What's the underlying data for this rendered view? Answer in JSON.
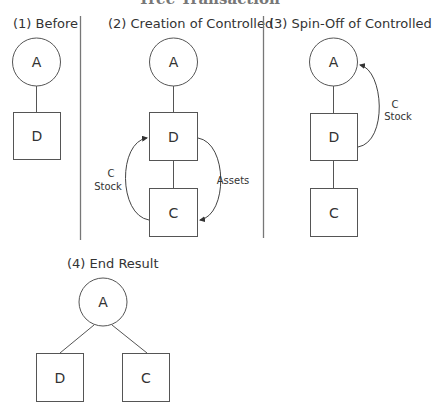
{
  "figure": {
    "cut_title": "Tree Transaction",
    "separator_color": "#777777",
    "stroke_color": "#555555"
  },
  "panels": [
    {
      "title": "(1) Before",
      "nodes": {
        "parent": "A",
        "child1": "D"
      }
    },
    {
      "title": "(2) Creation of Controlled",
      "nodes": {
        "parent": "A",
        "child1": "D",
        "child2": "C"
      },
      "edge_labels": {
        "left_line1": "C",
        "left_line2": "Stock",
        "right": "Assets"
      }
    },
    {
      "title": "(3) Spin-Off of Controlled",
      "nodes": {
        "parent": "A",
        "child1": "D",
        "child2": "C"
      },
      "edge_labels": {
        "right_line1": "C",
        "right_line2": "Stock"
      }
    },
    {
      "title": "(4) End Result",
      "nodes": {
        "parent": "A",
        "child1": "D",
        "child2": "C"
      }
    }
  ]
}
